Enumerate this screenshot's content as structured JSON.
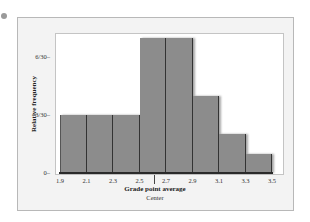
{
  "chart_data": {
    "type": "bar",
    "title": "",
    "xlabel": "Grade point average",
    "xsublabel": "Center",
    "ylabel": "Relative frequency",
    "bin_edges": [
      1.9,
      2.1,
      2.3,
      2.5,
      2.7,
      2.9,
      3.1,
      3.3,
      3.5
    ],
    "x_tick_labels": [
      "1.9",
      "2.1",
      "2.3",
      "2.5",
      "2.7",
      "2.9",
      "3.1",
      "3.3",
      "3.5"
    ],
    "y_tick_labels": [
      "0",
      "3/30",
      "6/30"
    ],
    "categories": [
      "1.9-2.1",
      "2.1-2.3",
      "2.3-2.5",
      "2.5-2.7",
      "2.7-2.9",
      "2.9-3.1",
      "3.1-3.3",
      "3.3-3.5"
    ],
    "values": [
      0.1,
      0.1,
      0.1,
      0.2333,
      0.2333,
      0.1333,
      0.0667,
      0.0333
    ],
    "values_as_fraction": [
      "3/30",
      "3/30",
      "3/30",
      "7/30",
      "7/30",
      "4/30",
      "2/30",
      "1/30"
    ],
    "counts_out_of_30": [
      3,
      3,
      3,
      7,
      7,
      4,
      2,
      1
    ],
    "ylim": [
      0,
      0.2333
    ],
    "grid": false,
    "legend": null,
    "bar_color": "#8c8c8c",
    "center_marker": 2.6
  },
  "labels": {
    "y0": "0–",
    "y3": "3/30–",
    "y6": "6/30–",
    "xtitle": "Grade point average",
    "xsub": "Center",
    "ytitle": "Relative frequency"
  }
}
